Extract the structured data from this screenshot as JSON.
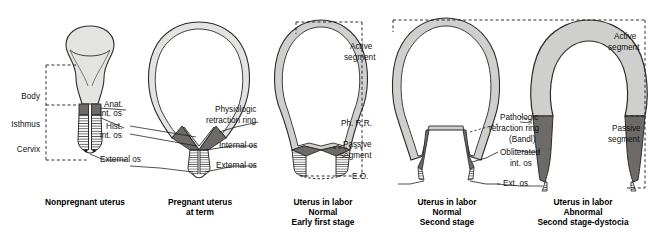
{
  "figure": {
    "colors": {
      "wall_light": "#e3e3e1",
      "wall_mid": "#cfcfcd",
      "ring_dark": "#6d6a68",
      "outline": "#2b2b2b",
      "cavity": "#ffffff",
      "leader": "#1a1a1a"
    }
  },
  "panels": [
    {
      "id": "nonpregnant",
      "caption": [
        "Nonpregnant uterus"
      ],
      "labels": [
        "Body",
        "Isthmus",
        "Cervix",
        "Anat. int. os",
        "Hist. int. os",
        "External os"
      ]
    },
    {
      "id": "pregnant-term",
      "caption": [
        "Pregnant uterus",
        "at term"
      ],
      "labels": [
        "Physiologic retraction ring",
        "Internal os",
        "External os"
      ]
    },
    {
      "id": "labor-early-first",
      "caption": [
        "Uterus in labor",
        "Normal",
        "Early first stage"
      ],
      "labels": [
        "Active segment",
        "Ph. R.R.",
        "Passive segment",
        "E.O."
      ]
    },
    {
      "id": "labor-second",
      "caption": [
        "Uterus in labor",
        "Normal",
        "Second stage"
      ],
      "labels": []
    },
    {
      "id": "labor-dystocia",
      "caption": [
        "Uterus in labor",
        "Abnormal",
        "Second stage-dystocia"
      ],
      "labels": [
        "Pathologic retraction ring (Bandl)",
        "Obliterated int. os",
        "Ext. os",
        "Active segment",
        "Passive segment"
      ]
    }
  ],
  "left_labels": {
    "body": "Body",
    "isthmus": "Isthmus",
    "cervix": "Cervix",
    "anat_int_os_1": "Anat.",
    "anat_int_os_2": "int. os",
    "hist_int_os_1": "Hist.",
    "hist_int_os_2": "int. os",
    "external_os": "External os"
  },
  "mid_labels": {
    "physiologic_1": "Physiologic",
    "physiologic_2": "retraction ring",
    "internal_os": "Internal os",
    "external_os": "External os"
  },
  "panel3_labels": {
    "active_1": "Active",
    "active_2": "segment",
    "ph_rr": "Ph. R.R.",
    "passive_1": "Passive",
    "passive_2": "segment",
    "eo": "E.O."
  },
  "panel5_labels": {
    "pathologic_1": "Pathologic",
    "pathologic_2": "retraction ring",
    "pathologic_3": "(Bandl)",
    "obliterated_1": "Obliterated",
    "obliterated_2": "int. os",
    "ext_os": "Ext. os",
    "active_1": "Active",
    "active_2": "segment",
    "passive_1": "Passive",
    "passive_2": "segment"
  },
  "captions": {
    "c1_l1": "Nonpregnant uterus",
    "c2_l1": "Pregnant uterus",
    "c2_l2": "at term",
    "c3_l1": "Uterus in labor",
    "c3_l2": "Normal",
    "c3_l3": "Early first stage",
    "c4_l1": "Uterus in labor",
    "c4_l2": "Normal",
    "c4_l3": "Second stage",
    "c5_l1": "Uterus in labor",
    "c5_l2": "Abnormal",
    "c5_l3": "Second stage-dystocia"
  }
}
